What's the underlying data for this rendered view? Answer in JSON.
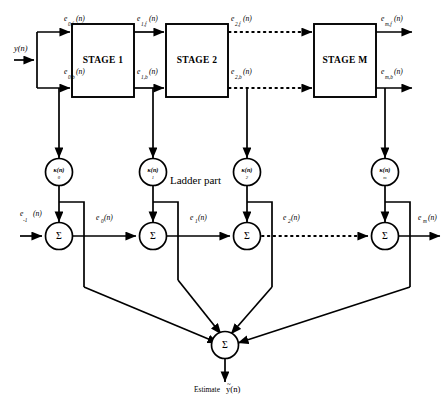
{
  "diagram": {
    "ladder_label": "Ladder part",
    "input_label": "y(n)",
    "output_prefix": "Estimate",
    "output_symbol": "y(n)",
    "output_overbar": "~",
    "stages": [
      {
        "id": "stage-1",
        "label": "STAGE 1"
      },
      {
        "id": "stage-2",
        "label": "STAGE 2"
      },
      {
        "id": "stage-m",
        "label": "STAGE M"
      }
    ],
    "forward_signals": [
      {
        "id": "e0f",
        "base": "e",
        "sub": "0,f",
        "arg": "(n)"
      },
      {
        "id": "e1f",
        "base": "e",
        "sub": "1,f",
        "arg": "(n)"
      },
      {
        "id": "e2f",
        "base": "e",
        "sub": "2,f",
        "arg": "(n)"
      },
      {
        "id": "emf",
        "base": "e",
        "sub": "m,f",
        "arg": "(n)"
      }
    ],
    "backward_signals": [
      {
        "id": "e0b",
        "base": "e",
        "sub": "0,b",
        "arg": "(n)"
      },
      {
        "id": "e1b",
        "base": "e",
        "sub": "1,b",
        "arg": "(n)"
      },
      {
        "id": "e2b",
        "base": "e",
        "sub": "2,b",
        "arg": "(n)"
      },
      {
        "id": "emb",
        "base": "e",
        "sub": "m,b",
        "arg": "(n)"
      }
    ],
    "ladder_coefficients": [
      {
        "id": "k0",
        "base": "κ",
        "arg": "(n)",
        "sub": "0"
      },
      {
        "id": "k1",
        "base": "κ",
        "arg": "(n)",
        "sub": "1"
      },
      {
        "id": "k2",
        "base": "κ",
        "arg": "(n)",
        "sub": "2"
      },
      {
        "id": "km",
        "base": "κ",
        "arg": "(n)",
        "sub": "m"
      }
    ],
    "ladder_signals": [
      {
        "id": "em1",
        "base": "e",
        "sub": "-1",
        "arg": "(n)"
      },
      {
        "id": "e0",
        "base": "e",
        "sub": "0",
        "arg": "(n)"
      },
      {
        "id": "e1",
        "base": "e",
        "sub": "1",
        "arg": "(n)"
      },
      {
        "id": "e2",
        "base": "e",
        "sub": "2",
        "arg": "(n)"
      },
      {
        "id": "em",
        "base": "e",
        "sub": "m",
        "arg": "(n)"
      }
    ],
    "summers": [
      {
        "id": "sum-0",
        "glyph": "Σ"
      },
      {
        "id": "sum-1",
        "glyph": "Σ"
      },
      {
        "id": "sum-2",
        "glyph": "Σ"
      },
      {
        "id": "sum-m",
        "glyph": "Σ"
      },
      {
        "id": "sum-final",
        "glyph": "Σ"
      }
    ],
    "colors": {
      "line": "#000000",
      "background": "#ffffff",
      "text": "#000000"
    }
  }
}
